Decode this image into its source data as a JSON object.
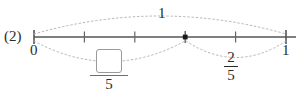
{
  "problem": {
    "number": "(2)"
  },
  "numberline": {
    "start_label": "0",
    "end_label": "1",
    "min": 0,
    "max": 1,
    "divisions": 5,
    "tick_fractions": [
      0,
      0.2,
      0.4,
      0.6,
      0.8,
      1
    ],
    "point_marker_fraction": 0.6,
    "line_color": "#555555",
    "tick_color": "#555555"
  },
  "arcs": {
    "top": {
      "label": "1",
      "from_fraction": 0,
      "to_fraction": 1,
      "style": "dotted",
      "color": "#b0b0b0"
    },
    "bottom_left": {
      "from_fraction": 0,
      "to_fraction": 0.6,
      "style": "dotted",
      "color": "#b0b0b0",
      "label_numerator": "",
      "label_denominator": "5"
    },
    "bottom_right": {
      "from_fraction": 0.6,
      "to_fraction": 1,
      "style": "dotted",
      "color": "#b0b0b0",
      "label_numerator": "2",
      "label_denominator": "5"
    }
  },
  "answer_input": {
    "value": "",
    "placeholder": ""
  }
}
